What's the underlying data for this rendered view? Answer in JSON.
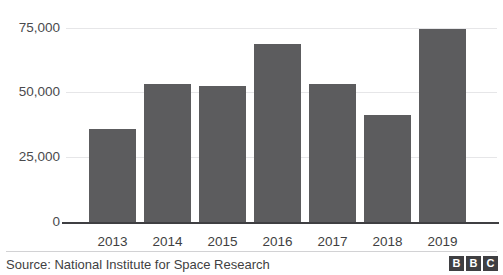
{
  "title_clipped": "Number of fires detected",
  "chart_data": {
    "type": "bar",
    "title": "",
    "xlabel": "",
    "ylabel": "",
    "categories": [
      "2013",
      "2014",
      "2015",
      "2016",
      "2017",
      "2018",
      "2019"
    ],
    "values": [
      36000,
      53300,
      52300,
      68700,
      53200,
      41200,
      74500
    ],
    "ylim": [
      0,
      75000
    ],
    "yticks": [
      0,
      25000,
      50000,
      75000
    ],
    "ytick_labels": [
      "0",
      "25,000",
      "50,000",
      "75,000"
    ],
    "grid": true,
    "legend": "none",
    "bar_color": "#5c5c5e"
  },
  "footer": {
    "source": "Source: National Institute for Space Research",
    "logo_letters": [
      "B",
      "B",
      "C"
    ]
  },
  "colors": {
    "bar": "#5c5c5e",
    "gridline": "#e6e6e8",
    "axis": "#3f3f42",
    "text": "#3f3f42",
    "background": "#ffffff"
  }
}
